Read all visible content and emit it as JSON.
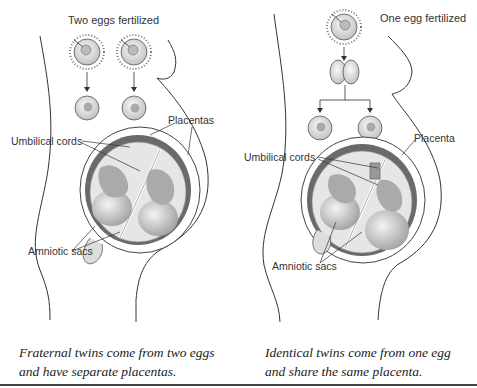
{
  "left_panel": {
    "title": "Two eggs fertilized",
    "labels": {
      "placentas": "Placentas",
      "umbilical_cords": "Umbilical cords",
      "amniotic_sacs": "Amniotic sacs"
    },
    "caption_line1": "Fraternal twins come from two eggs",
    "caption_line2": "and have separate placentas."
  },
  "right_panel": {
    "title": "One egg fertilized",
    "labels": {
      "placenta": "Placenta",
      "umbilical_cords": "Umbilical cords",
      "amniotic_sacs": "Amniotic sacs"
    },
    "caption_line1": "Identical twins come from one egg",
    "caption_line2": "and share the same placenta."
  },
  "colors": {
    "line": "#333333",
    "uterus_wall": "#6a6a6a",
    "sac_fill": "#e6e6e6",
    "fetus_fill": "#cfcfcf",
    "egg_fill": "#e9e9e9"
  }
}
